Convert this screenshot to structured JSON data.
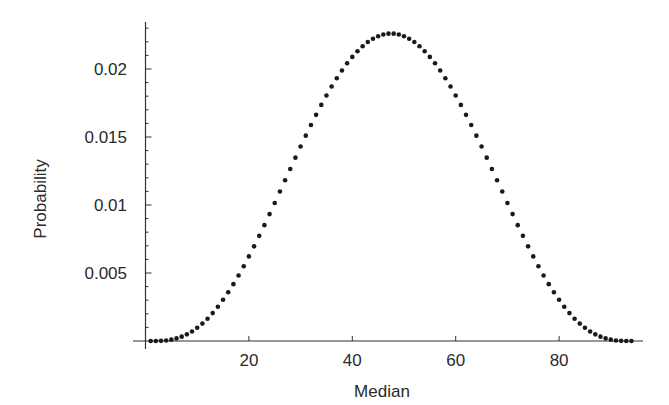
{
  "chart_data": {
    "type": "scatter",
    "title": "",
    "xlabel": "Median",
    "ylabel": "Probability",
    "xlim": [
      0,
      95
    ],
    "ylim": [
      0,
      0.025
    ],
    "grid": false,
    "legend": null,
    "x_ticks": [
      20,
      40,
      60,
      80
    ],
    "x_tick_labels": [
      "20",
      "40",
      "60",
      "80"
    ],
    "y_ticks": [
      0.005,
      0.01,
      0.015,
      0.02
    ],
    "y_tick_labels": [
      "0.005",
      "0.01",
      "0.015",
      "0.02"
    ],
    "marker_color": "#1a1a1a",
    "series": [
      {
        "name": "Probability of median",
        "x": [
          1,
          2,
          3,
          4,
          5,
          6,
          7,
          8,
          9,
          10,
          11,
          12,
          13,
          14,
          15,
          16,
          17,
          18,
          19,
          20,
          21,
          22,
          23,
          24,
          25,
          26,
          27,
          28,
          29,
          30,
          31,
          32,
          33,
          34,
          35,
          36,
          37,
          38,
          39,
          40,
          41,
          42,
          43,
          44,
          45,
          46,
          47,
          48,
          49,
          50,
          51,
          52,
          53,
          54,
          55,
          56,
          57,
          58,
          59,
          60,
          61,
          62,
          63,
          64,
          65,
          66,
          67,
          68,
          69,
          70,
          71,
          72,
          73,
          74,
          75,
          76,
          77,
          78,
          79,
          80,
          81,
          82,
          83,
          84,
          85,
          86,
          87,
          88,
          89,
          90,
          91,
          92,
          93,
          94
        ],
        "values": [
          0.0,
          0.0,
          1e-05,
          4e-05,
          0.0001,
          0.00019,
          0.00032,
          0.00049,
          0.0007,
          0.00097,
          0.00128,
          0.00164,
          0.00205,
          0.00252,
          0.00303,
          0.00358,
          0.00418,
          0.00482,
          0.0055,
          0.00622,
          0.00696,
          0.00773,
          0.00852,
          0.00933,
          0.01015,
          0.01099,
          0.01182,
          0.01265,
          0.01348,
          0.0143,
          0.0151,
          0.01588,
          0.01663,
          0.01736,
          0.01805,
          0.01871,
          0.01932,
          0.01989,
          0.02042,
          0.02089,
          0.02131,
          0.02167,
          0.02198,
          0.02222,
          0.02241,
          0.02254,
          0.0226,
          0.0226,
          0.02254,
          0.02241,
          0.02222,
          0.02198,
          0.02167,
          0.02131,
          0.02089,
          0.02042,
          0.01989,
          0.01932,
          0.01871,
          0.01805,
          0.01736,
          0.01663,
          0.01588,
          0.0151,
          0.0143,
          0.01348,
          0.01265,
          0.01182,
          0.01099,
          0.01015,
          0.00933,
          0.00852,
          0.00773,
          0.00696,
          0.00622,
          0.0055,
          0.00482,
          0.00418,
          0.00358,
          0.00303,
          0.00252,
          0.00205,
          0.00164,
          0.00128,
          0.00097,
          0.0007,
          0.00049,
          0.00032,
          0.00019,
          0.0001,
          4e-05,
          1e-05,
          0.0,
          0.0
        ]
      }
    ]
  }
}
